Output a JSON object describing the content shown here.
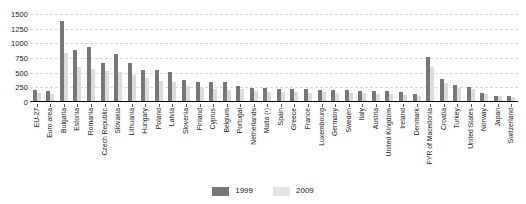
{
  "chart_data": {
    "type": "bar",
    "title": "",
    "subtitle": "",
    "xlabel": "",
    "ylabel": "",
    "ylim": [
      0,
      1500
    ],
    "ytick_step": 250,
    "yticks": [
      "1500",
      "1250",
      "1000",
      "750",
      "500",
      "250",
      "0"
    ],
    "grid": true,
    "legend_position": "bottom",
    "categories": [
      "EU-27",
      "Euro area",
      "Bulgaria",
      "Estonia",
      "Romania",
      "Czech Republic",
      "Slovakia",
      "Lithuania",
      "Hungary",
      "Poland",
      "Latvia",
      "Slovenia",
      "Finland",
      "Cyprus",
      "Belgium",
      "Portugal",
      "Netherlands",
      "Malta (¹)",
      "Spain",
      "Greece",
      "France",
      "Luxembourg",
      "Germany",
      "Sweden",
      "Italy",
      "Austria",
      "United Kingdom",
      "Ireland",
      "Denmark",
      "FYR of Macedonia",
      "Croatia",
      "Turkey",
      "United States",
      "Norway",
      "Japan",
      "Switzerland"
    ],
    "series": [
      {
        "name": "1999",
        "color": "#777777",
        "values": [
          205,
          185,
          1375,
          890,
          930,
          670,
          820,
          665,
          545,
          540,
          515,
          370,
          340,
          345,
          340,
          280,
          240,
          235,
          230,
          220,
          215,
          200,
          210,
          205,
          195,
          185,
          185,
          170,
          130,
          760,
          400,
          290,
          255,
          160,
          110,
          105
        ]
      },
      {
        "name": "2009",
        "color": "#dcdcdc",
        "values": [
          150,
          140,
          835,
          600,
          565,
          525,
          520,
          460,
          410,
          360,
          345,
          265,
          240,
          215,
          205,
          215,
          185,
          175,
          165,
          165,
          160,
          170,
          155,
          155,
          150,
          140,
          130,
          120,
          100,
          600,
          325,
          240,
          215,
          135,
          95,
          85
        ]
      }
    ],
    "legend": [
      "1999",
      "2009"
    ]
  }
}
